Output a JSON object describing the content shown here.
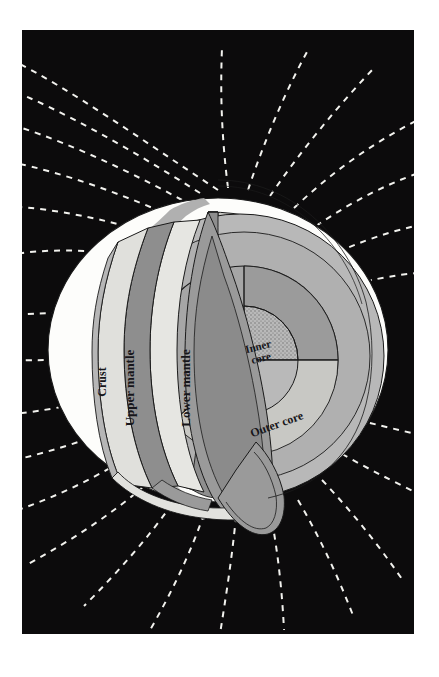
{
  "figure": {
    "panel": {
      "background_color": "#0c0b0c",
      "margin_color": "#ffffff",
      "x": 22,
      "y": 30,
      "width": 392,
      "height": 604
    }
  },
  "earth": {
    "center_x": 196,
    "center_y": 320,
    "radius_x": 170,
    "radius_y": 152,
    "surface_color": "#fdfdfb",
    "shadow_color": "#a9a9a9",
    "outline_color": "#1a1a1a"
  },
  "layers": [
    {
      "id": "crust",
      "label": "Crust",
      "color": "#b6b6b6",
      "label_rotation": -90,
      "label_x": 76,
      "label_y": 348
    },
    {
      "id": "upper-mantle",
      "label": "Upper mantle",
      "color": "#e0e0dc",
      "label_rotation": -90,
      "label_x": 110,
      "label_y": 355
    },
    {
      "id": "lower-mantle",
      "label": "Lower mantle",
      "color": "#e6e6e2",
      "label_rotation": -90,
      "label_x": 168,
      "label_y": 355
    },
    {
      "id": "outer-core",
      "label": "Outer core",
      "color": "#a6a6a6",
      "label_rotation": -20,
      "label_x": 268,
      "label_y": 404
    },
    {
      "id": "inner-core",
      "label_line1": "Inner",
      "label_line2": "core",
      "color": "#b9b9b9",
      "label_rotation": -16,
      "label_x": 249,
      "label_y": 334
    }
  ],
  "palette": {
    "mantle_band_mid": "#8e8e8e",
    "mantle_band_light": "#cfcfcb",
    "interior_light": "#b8b8b8",
    "interior_mid": "#a3a3a3",
    "interior_dark": "#8b8b8b",
    "wedge_face": "#9a9a9a",
    "wedge_face_dark": "#858585",
    "stipple": "#6d6d6d"
  },
  "magnetic_field": {
    "line_style": "dashed",
    "line_color": "#f2f2ee",
    "dash_pattern": "6 6",
    "stroke_width": 2.0,
    "line_count": 22,
    "description": "White dashed dipole field lines arcing outward from the sphere toward all four corners"
  }
}
